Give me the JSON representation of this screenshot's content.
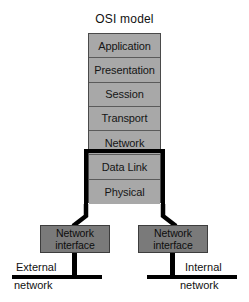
{
  "diagram": {
    "title": "OSI model",
    "type": "network-layer-diagram",
    "colors": {
      "background": "#ffffff",
      "osi_layer_fill": "#a8a8a8",
      "osi_layer_border": "#5a5a5a",
      "nic_fill": "#7a7a7a",
      "nic_border": "#3d3d3d",
      "highlight_outline": "#000000",
      "text": "#111111"
    }
  },
  "osi_stack": {
    "name": "osi-model-stack",
    "layers": [
      {
        "label": "Application",
        "index": 7,
        "highlighted": false
      },
      {
        "label": "Presentation",
        "index": 6,
        "highlighted": false
      },
      {
        "label": "Session",
        "index": 5,
        "highlighted": false
      },
      {
        "label": "Transport",
        "index": 4,
        "highlighted": false
      },
      {
        "label": "Network",
        "index": 3,
        "highlighted": false
      },
      {
        "label": "Data Link",
        "index": 2,
        "highlighted": true
      },
      {
        "label": "Physical",
        "index": 1,
        "highlighted": true
      }
    ],
    "highlight_group": [
      "Data Link",
      "Physical"
    ]
  },
  "interfaces": [
    {
      "id": "left",
      "line1": "Network",
      "line2": "interface",
      "connects_to": "external-network"
    },
    {
      "id": "right",
      "line1": "Network",
      "line2": "interface",
      "connects_to": "internal-network"
    }
  ],
  "networks": [
    {
      "id": "external-network",
      "line1": "External",
      "line2": "network"
    },
    {
      "id": "internal-network",
      "line1": "Internal",
      "line2": "network"
    }
  ]
}
